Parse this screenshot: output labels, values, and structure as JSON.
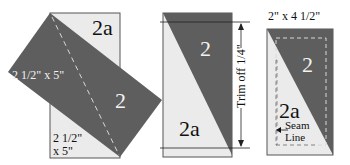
{
  "colors": {
    "dark": "#5e5e5e",
    "light": "#ebebeb",
    "outline": "#555555",
    "dashed": "#d8d8d8",
    "text_dark": "#111111",
    "text_light": "#f2f2f2"
  },
  "panel1": {
    "light_label": "2a",
    "dark_label": "2",
    "rotated_size": "2 1/2\" x 5\"",
    "base_size_line1": "2 1/2\"",
    "base_size_line2": "x 5\""
  },
  "panel2": {
    "dark_label": "2",
    "light_label": "2a",
    "trim_label": "Trim off 1/4\""
  },
  "panel3": {
    "size_label": "2\" x 4 1/2\"",
    "dark_label": "2",
    "light_label": "2a",
    "seam_line1": "Seam",
    "seam_line2": "Line"
  }
}
